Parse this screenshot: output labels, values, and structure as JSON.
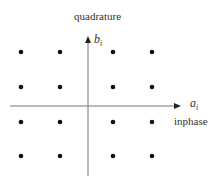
{
  "diagram": {
    "type": "constellation",
    "title_top": "quadrature",
    "y_axis_label": "b",
    "y_axis_subscript": "i",
    "x_axis_label": "a",
    "x_axis_subscript": "i",
    "x_axis_caption": "inphase",
    "colors": {
      "axis": "#777777",
      "dot": "#111111",
      "text": "#333333"
    },
    "points": [
      {
        "col": 0,
        "row": 0
      },
      {
        "col": 1,
        "row": 0
      },
      {
        "col": 2,
        "row": 0
      },
      {
        "col": 3,
        "row": 0
      },
      {
        "col": 0,
        "row": 1
      },
      {
        "col": 1,
        "row": 1
      },
      {
        "col": 2,
        "row": 1
      },
      {
        "col": 3,
        "row": 1
      },
      {
        "col": 0,
        "row": 2
      },
      {
        "col": 1,
        "row": 2
      },
      {
        "col": 2,
        "row": 2
      },
      {
        "col": 3,
        "row": 2
      },
      {
        "col": 0,
        "row": 3
      },
      {
        "col": 1,
        "row": 3
      },
      {
        "col": 2,
        "row": 3
      },
      {
        "col": 3,
        "row": 3
      }
    ]
  }
}
